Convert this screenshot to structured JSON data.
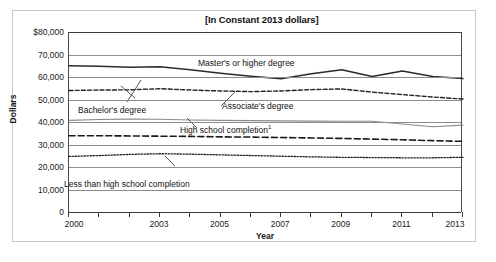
{
  "chart_data": {
    "type": "line",
    "title": "[In Constant 2013 dollars]",
    "xlabel": "Year",
    "ylabel": "Dollars",
    "xlim": [
      2000,
      2013
    ],
    "ylim": [
      0,
      80000
    ],
    "grid": true,
    "legend_position": "inline-annotations",
    "x": [
      2000,
      2001,
      2002,
      2003,
      2004,
      2005,
      2006,
      2007,
      2008,
      2009,
      2010,
      2011,
      2012,
      2013
    ],
    "y_ticks": [
      {
        "value": 80000,
        "label": "$80,000"
      },
      {
        "value": 70000,
        "label": "70,000"
      },
      {
        "value": 60000,
        "label": "60,000"
      },
      {
        "value": 50000,
        "label": "50,000"
      },
      {
        "value": 40000,
        "label": "40,000"
      },
      {
        "value": 30000,
        "label": "30,000"
      },
      {
        "value": 20000,
        "label": "20,000"
      },
      {
        "value": 10000,
        "label": "10,000"
      },
      {
        "value": 0,
        "label": "0"
      }
    ],
    "x_ticks": [
      {
        "value": 2000,
        "label": "2000"
      },
      {
        "value": 2001,
        "label": ""
      },
      {
        "value": 2002,
        "label": ""
      },
      {
        "value": 2003,
        "label": "2003"
      },
      {
        "value": 2004,
        "label": ""
      },
      {
        "value": 2005,
        "label": "2005"
      },
      {
        "value": 2006,
        "label": ""
      },
      {
        "value": 2007,
        "label": "2007"
      },
      {
        "value": 2008,
        "label": ""
      },
      {
        "value": 2009,
        "label": "2009"
      },
      {
        "value": 2010,
        "label": ""
      },
      {
        "value": 2011,
        "label": "2011"
      },
      {
        "value": 2012,
        "label": ""
      },
      {
        "value": 2013,
        "label": "2013"
      }
    ],
    "series": [
      {
        "name": "Master's or higher degree",
        "style": "solid",
        "color": "#2b2b2b",
        "width": 1.5,
        "values": [
          65000,
          64800,
          64300,
          64600,
          63200,
          61700,
          60300,
          59200,
          61400,
          63200,
          60200,
          62700,
          60200,
          59300
        ]
      },
      {
        "name": "Bachelor's degree",
        "style": "dashed-fine",
        "color": "#222222",
        "width": 1.4,
        "values": [
          54000,
          54200,
          54300,
          54800,
          54200,
          53800,
          53500,
          53800,
          54400,
          54700,
          53300,
          52200,
          51100,
          50200
        ]
      },
      {
        "name": "Associate's degree",
        "style": "solid-thin",
        "color": "#8a8a8a",
        "width": 1.1,
        "values": [
          40700,
          41100,
          41300,
          41200,
          40900,
          40700,
          40600,
          40500,
          40400,
          40300,
          40300,
          39100,
          37900,
          38600
        ]
      },
      {
        "name": "High school completion",
        "style": "dashed-bold",
        "color": "#1a1a1a",
        "width": 1.6,
        "footnote": "1",
        "values": [
          33900,
          33900,
          33800,
          33700,
          33600,
          33400,
          33300,
          33100,
          32900,
          32700,
          32400,
          32100,
          31700,
          31400
        ]
      },
      {
        "name": "Less than high school completion",
        "style": "dotted",
        "color": "#1a1a1a",
        "width": 1.3,
        "values": [
          24700,
          25100,
          25600,
          25900,
          25700,
          25400,
          25100,
          24800,
          24500,
          24300,
          24200,
          24100,
          24100,
          24300
        ]
      }
    ],
    "annotations": [
      {
        "name": "masters-label",
        "text": "Master's or higher degree",
        "x": 198,
        "y": 58
      },
      {
        "name": "bachelors-label",
        "text": "Bachelor's degree",
        "x": 78,
        "y": 105
      },
      {
        "name": "associates-label",
        "text": "Associate's degree",
        "x": 222,
        "y": 101
      },
      {
        "name": "highschool-label",
        "text": "High school completion",
        "x": 180,
        "y": 124,
        "footnote": "1"
      },
      {
        "name": "lessthanhs-label",
        "text": "Less than high school completion",
        "x": 64,
        "y": 179
      }
    ]
  }
}
